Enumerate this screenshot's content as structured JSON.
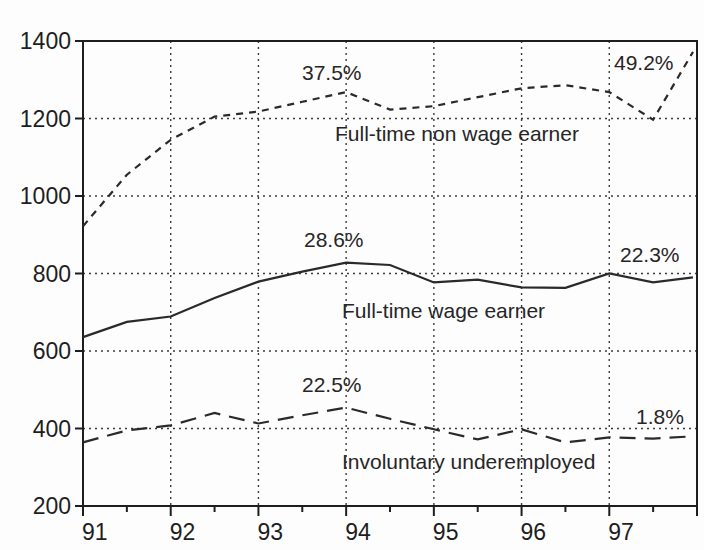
{
  "chart_data": {
    "type": "line",
    "title": "",
    "xlabel": "",
    "ylabel": "",
    "xlim": [
      91,
      98
    ],
    "ylim": [
      200,
      1400
    ],
    "grid": true,
    "legend": "inline labels",
    "x_ticks": [
      "91",
      "92",
      "93",
      "94",
      "95",
      "96",
      "97"
    ],
    "y_ticks": [
      "1400",
      "1200",
      "1000",
      "800",
      "600",
      "400",
      "200"
    ],
    "x": [
      91,
      91.5,
      92,
      92.5,
      93,
      93.5,
      94,
      94.5,
      95,
      95.5,
      96,
      96.5,
      97,
      97.5,
      98
    ],
    "series": [
      {
        "name": "Full-time non wage earner",
        "line_style": "short-dash",
        "values": [
          922,
          1055,
          1145,
          1205,
          1218,
          1243,
          1268,
          1223,
          1232,
          1255,
          1278,
          1286,
          1268,
          1197,
          1372
        ]
      },
      {
        "name": "Full-time wage earner",
        "line_style": "solid",
        "values": [
          636,
          675,
          689,
          737,
          779,
          805,
          828,
          822,
          777,
          784,
          764,
          763,
          800,
          777,
          790
        ]
      },
      {
        "name": "Involuntary underemployed",
        "line_style": "long-dash",
        "values": [
          364,
          395,
          408,
          440,
          413,
          434,
          454,
          425,
          398,
          372,
          398,
          364,
          377,
          374,
          380
        ]
      }
    ],
    "annotations": [
      {
        "text": "37.5%",
        "series": "Full-time non wage earner",
        "near_x": 94
      },
      {
        "text": "49.2%",
        "series": "Full-time non wage earner",
        "near_x": 97.5
      },
      {
        "text": "28.6%",
        "series": "Full-time wage earner",
        "near_x": 94
      },
      {
        "text": "22.3%",
        "series": "Full-time wage earner",
        "near_x": 97.5
      },
      {
        "text": "22.5%",
        "series": "Involuntary underemployed",
        "near_x": 94
      },
      {
        "text": "1.8%",
        "series": "Involuntary underemployed",
        "near_x": 97.5
      }
    ]
  },
  "labels": {
    "series_nonwage": "Full-time non wage earner",
    "series_wage": "Full-time wage earner",
    "series_under": "Involuntary underemployed",
    "ann_nonwage_94": "37.5%",
    "ann_nonwage_97": "49.2%",
    "ann_wage_94": "28.6%",
    "ann_wage_97": "22.3%",
    "ann_under_94": "22.5%",
    "ann_under_97": "1.8%"
  },
  "colors": {
    "line": "#2a2a2a",
    "grid": "#3a3a3a",
    "axis": "#1e1e1e",
    "background": "#fdfdfd"
  }
}
